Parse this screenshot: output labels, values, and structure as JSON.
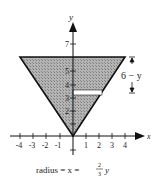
{
  "diagram": {
    "axes": {
      "x_label": "x",
      "y_label": "y",
      "x_ticks": [
        "-4",
        "-3",
        "-2",
        "-1",
        "1",
        "2",
        "3",
        "4"
      ],
      "y_ticks": [
        "2",
        "3",
        "4",
        "5",
        "7"
      ]
    },
    "shape": {
      "type": "inverted-triangle",
      "vertices": [
        [
          0,
          0
        ],
        [
          -4,
          6
        ],
        [
          4,
          6
        ]
      ],
      "fill": "#a9a9a9"
    },
    "strip": {
      "y": 3.5,
      "from_x": 0,
      "to_x": 2.33
    },
    "dimension_label": "6 − y",
    "caption": {
      "prefix": "radius = x = ",
      "numerator": "2",
      "denominator": "3",
      "suffix": "y"
    }
  }
}
